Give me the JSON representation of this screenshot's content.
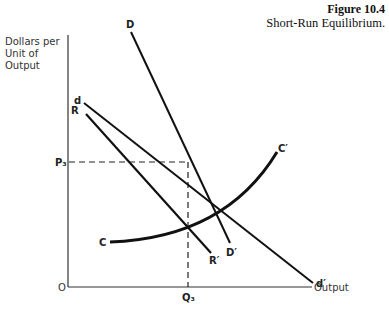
{
  "figure": {
    "number": "Figure 10.4",
    "title": "Short-Run Equilibrium."
  },
  "axes": {
    "y_label": "Dollars per Unit of Output",
    "x_label": "Output",
    "origin": "O",
    "price_tick": "P₃",
    "quantity_tick": "Q₃"
  },
  "curves": {
    "D_start": "D",
    "D_end": "D′",
    "d_start": "d",
    "d_end": "d′",
    "R_start": "R",
    "R_end": "R′",
    "C_start": "C",
    "C_end": "C′"
  },
  "colors": {
    "line": "#111111",
    "background": "#ffffff"
  }
}
